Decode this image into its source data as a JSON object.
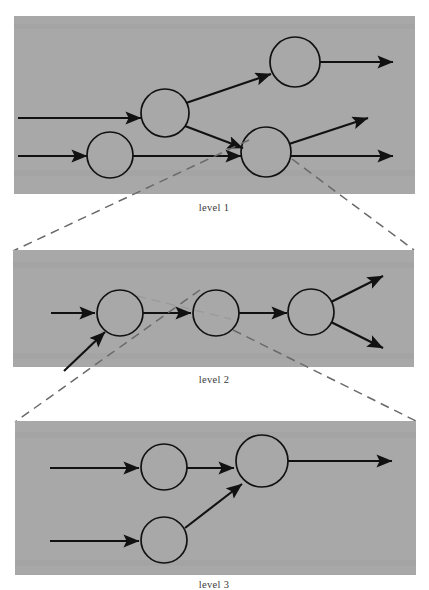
{
  "figure": {
    "background_color": "#ffffff",
    "panel_fill": "#a8a8a8",
    "stroke_color": "#111111",
    "dash_color": "#6a6a6a",
    "label_color": "#3a3a3a"
  },
  "panels": [
    {
      "id": "level-1",
      "label": "level 1",
      "label_x": 214,
      "label_y": 211,
      "rect": {
        "x": 14,
        "y": 16,
        "width": 401,
        "height": 178
      },
      "nodes": [
        {
          "id": "n1",
          "cx": 110,
          "cy": 155,
          "r": 23
        },
        {
          "id": "n2",
          "cx": 165,
          "cy": 113,
          "r": 24
        },
        {
          "id": "n3",
          "cx": 295,
          "cy": 62,
          "r": 25
        },
        {
          "id": "n4",
          "cx": 266,
          "cy": 152,
          "r": 25
        }
      ],
      "edges": [
        {
          "from": "input-a",
          "to": "n2",
          "x1": 18,
          "y1": 118,
          "x2": 141,
          "y2": 118,
          "arrow": true
        },
        {
          "from": "input-b",
          "to": "n1",
          "x1": 18,
          "y1": 156,
          "x2": 87,
          "y2": 156,
          "arrow": true
        },
        {
          "from": "n2",
          "to": "n3",
          "x1": 186,
          "y1": 102,
          "x2": 272,
          "y2": 73,
          "arrow": true
        },
        {
          "from": "n2",
          "to": "n4",
          "x1": 186,
          "y1": 125,
          "x2": 242,
          "y2": 147,
          "arrow": true
        },
        {
          "from": "n1",
          "to": "n4",
          "x1": 133,
          "y1": 156,
          "x2": 241,
          "y2": 156,
          "arrow": true
        },
        {
          "from": "n3",
          "to": "output-a",
          "x1": 320,
          "y1": 62,
          "x2": 393,
          "y2": 62,
          "arrow": true
        },
        {
          "from": "n4",
          "to": "output-b",
          "x1": 289,
          "y1": 143,
          "x2": 367,
          "y2": 117,
          "arrow": true
        },
        {
          "from": "n4",
          "to": "output-c",
          "x1": 291,
          "y1": 155,
          "x2": 393,
          "y2": 155,
          "arrow": true
        }
      ]
    },
    {
      "id": "level-2",
      "label": "level 2",
      "label_x": 214,
      "label_y": 383,
      "rect": {
        "x": 13,
        "y": 250,
        "width": 401,
        "height": 117
      },
      "nodes": [
        {
          "id": "m1",
          "cx": 120,
          "cy": 313,
          "r": 23
        },
        {
          "id": "m2",
          "cx": 216,
          "cy": 313,
          "r": 23
        },
        {
          "id": "m3",
          "cx": 311,
          "cy": 312,
          "r": 23
        }
      ],
      "edges": [
        {
          "from": "input-a",
          "to": "m1",
          "x1": 51,
          "y1": 313,
          "x2": 96,
          "y2": 313,
          "arrow": true
        },
        {
          "from": "input-b",
          "to": "m1",
          "x1": 63,
          "y1": 370,
          "x2": 104,
          "y2": 331,
          "arrow": true
        },
        {
          "from": "m1",
          "to": "m2",
          "x1": 143,
          "y1": 313,
          "x2": 192,
          "y2": 313,
          "arrow": true
        },
        {
          "from": "m2",
          "to": "m3",
          "x1": 239,
          "y1": 313,
          "x2": 288,
          "y2": 313,
          "arrow": true
        },
        {
          "from": "m3",
          "to": "output-a",
          "x1": 331,
          "y1": 302,
          "x2": 382,
          "y2": 277,
          "arrow": true
        },
        {
          "from": "m3",
          "to": "output-b",
          "x1": 331,
          "y1": 322,
          "x2": 382,
          "y2": 347,
          "arrow": true
        }
      ]
    },
    {
      "id": "level-3",
      "label": "level 3",
      "label_x": 214,
      "label_y": 588,
      "rect": {
        "x": 15,
        "y": 421,
        "width": 401,
        "height": 154
      },
      "nodes": [
        {
          "id": "k1",
          "cx": 164,
          "cy": 467,
          "r": 23
        },
        {
          "id": "k2",
          "cx": 262,
          "cy": 461,
          "r": 26
        },
        {
          "id": "k3",
          "cx": 164,
          "cy": 540,
          "r": 23
        }
      ],
      "edges": [
        {
          "from": "input-a",
          "to": "k1",
          "x1": 50,
          "y1": 468,
          "x2": 140,
          "y2": 468,
          "arrow": true
        },
        {
          "from": "input-b",
          "to": "k3",
          "x1": 50,
          "y1": 541,
          "x2": 140,
          "y2": 541,
          "arrow": true
        },
        {
          "from": "k1",
          "to": "k2",
          "x1": 187,
          "y1": 468,
          "x2": 235,
          "y2": 468,
          "arrow": true
        },
        {
          "from": "k3",
          "to": "k2",
          "x1": 184,
          "y1": 529,
          "x2": 241,
          "y2": 484,
          "arrow": true
        },
        {
          "from": "k2",
          "to": "output-a",
          "x1": 288,
          "y1": 461,
          "x2": 392,
          "y2": 461,
          "arrow": true
        }
      ]
    }
  ],
  "zoom_connectors": [
    {
      "id": "zoom-1-left",
      "x1": 248,
      "y1": 141,
      "x2": 13,
      "y2": 250
    },
    {
      "id": "zoom-1-right",
      "x1": 291,
      "y1": 158,
      "x2": 414,
      "y2": 250
    },
    {
      "id": "zoom-2-left",
      "x1": 199,
      "y1": 291,
      "x2": 15,
      "y2": 421
    },
    {
      "id": "zoom-2-right",
      "x1": 232,
      "y1": 331,
      "x2": 416,
      "y2": 421
    },
    {
      "id": "zoom-2-inner-a",
      "x1": 136,
      "y1": 297,
      "x2": 229,
      "y2": 319
    },
    {
      "id": "zoom-2-inner-b",
      "x1": 103,
      "y1": 331,
      "x2": 64,
      "y2": 371
    }
  ]
}
